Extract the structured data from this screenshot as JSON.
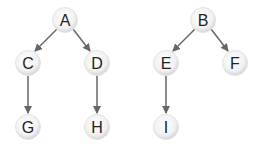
{
  "diagram": {
    "type": "forest",
    "colors": {
      "edge": "#666666",
      "node_fill_center": "#ffffff",
      "node_fill_edge": "#d8d8d8",
      "node_stroke": "#e6e6e6",
      "label": "#222222"
    },
    "nodes": [
      {
        "id": "A",
        "label": "A",
        "x": 65,
        "y": 20
      },
      {
        "id": "C",
        "label": "C",
        "x": 28,
        "y": 63
      },
      {
        "id": "D",
        "label": "D",
        "x": 97,
        "y": 63
      },
      {
        "id": "G",
        "label": "G",
        "x": 28,
        "y": 127
      },
      {
        "id": "H",
        "label": "H",
        "x": 97,
        "y": 127
      },
      {
        "id": "B",
        "label": "B",
        "x": 203,
        "y": 20
      },
      {
        "id": "E",
        "label": "E",
        "x": 166,
        "y": 63
      },
      {
        "id": "F",
        "label": "F",
        "x": 235,
        "y": 63
      },
      {
        "id": "I",
        "label": "I",
        "x": 166,
        "y": 127
      }
    ],
    "edges": [
      {
        "from": "A",
        "to": "C"
      },
      {
        "from": "A",
        "to": "D"
      },
      {
        "from": "C",
        "to": "G"
      },
      {
        "from": "D",
        "to": "H"
      },
      {
        "from": "B",
        "to": "E"
      },
      {
        "from": "B",
        "to": "F"
      },
      {
        "from": "E",
        "to": "I"
      }
    ]
  }
}
